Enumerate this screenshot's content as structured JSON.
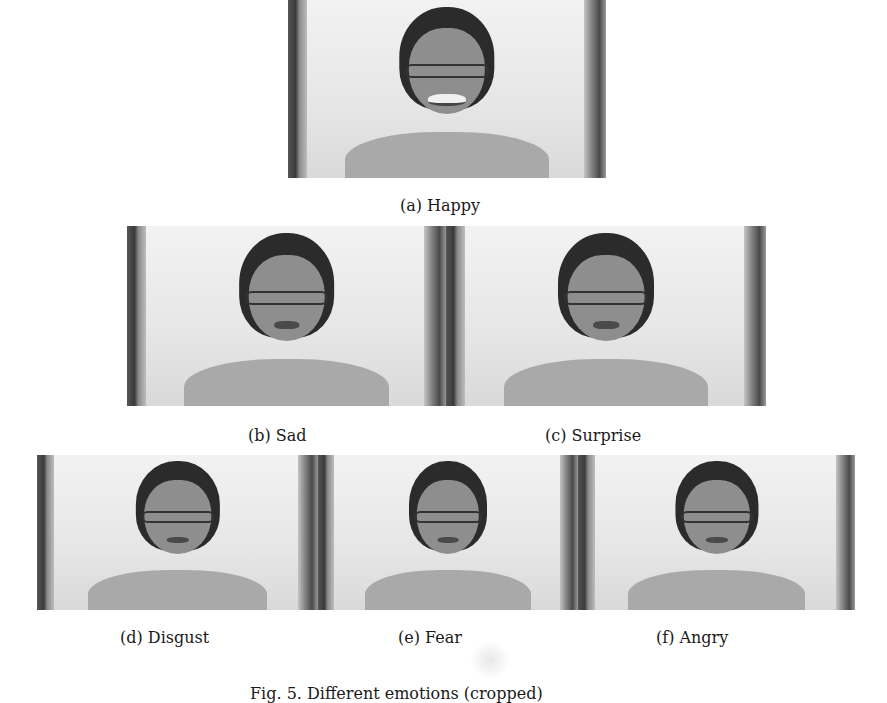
{
  "figure": {
    "panels": [
      {
        "id": "a",
        "label": "(a) Happy",
        "emotion": "Happy"
      },
      {
        "id": "b",
        "label": "(b) Sad",
        "emotion": "Sad"
      },
      {
        "id": "c",
        "label": "(c) Surprise",
        "emotion": "Surprise"
      },
      {
        "id": "d",
        "label": "(d) Disgust",
        "emotion": "Disgust"
      },
      {
        "id": "e",
        "label": "(e) Fear",
        "emotion": "Fear"
      },
      {
        "id": "f",
        "label": "(f) Angry",
        "emotion": "Angry"
      }
    ],
    "caption": "Fig. 5. Different emotions (cropped)"
  }
}
